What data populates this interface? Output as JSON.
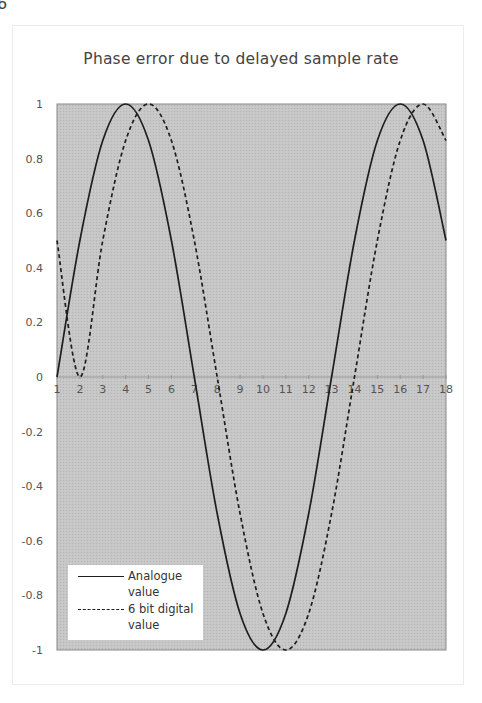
{
  "page_fragment": "6",
  "chart_data": {
    "type": "line",
    "title": "Phase error due to delayed sample rate",
    "xlabel": "",
    "ylabel": "",
    "x": [
      1,
      2,
      3,
      4,
      5,
      6,
      7,
      8,
      9,
      10,
      11,
      12,
      13,
      14,
      15,
      16,
      17,
      18
    ],
    "xlim": [
      1,
      18
    ],
    "ylim": [
      -1,
      1
    ],
    "x_ticks": [
      "1",
      "2",
      "3",
      "4",
      "5",
      "6",
      "7",
      "8",
      "9",
      "10",
      "11",
      "12",
      "13",
      "14",
      "15",
      "16",
      "17",
      "18"
    ],
    "y_ticks": [
      "1",
      "0.8",
      "0.6",
      "0.4",
      "0.2",
      "0",
      "-0.2",
      "-0.4",
      "-0.6",
      "-0.8",
      "-1"
    ],
    "grid": false,
    "legend_position": "lower-left inside plot",
    "series": [
      {
        "name": "Analogue value",
        "style": "solid",
        "values": [
          0,
          0.5,
          0.866,
          1,
          0.866,
          0.5,
          0,
          -0.5,
          -0.866,
          -1,
          -0.866,
          -0.5,
          0,
          0.5,
          0.866,
          1,
          0.866,
          0.5
        ]
      },
      {
        "name": "6 bit digital value",
        "style": "dashed",
        "values": [
          0.5,
          0,
          0.5,
          0.866,
          1,
          0.866,
          0.5,
          0,
          -0.5,
          -0.866,
          -1,
          -0.866,
          -0.5,
          0,
          0.5,
          0.866,
          1,
          0.866
        ]
      }
    ]
  },
  "legend": {
    "items": [
      {
        "line1": "Analogue",
        "line2": "value"
      },
      {
        "line1": "6 bit digital",
        "line2": "value"
      }
    ]
  },
  "colors": {
    "plot_fill": "#c6c6c6",
    "plot_border": "#8a8a8a",
    "line": "#1e1e1e",
    "axis": "#999999"
  }
}
